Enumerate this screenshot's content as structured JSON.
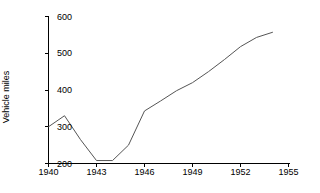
{
  "chart_data": {
    "type": "line",
    "title": "",
    "subtitle": "",
    "xlabel": "",
    "ylabel": "Vehicle miles",
    "xlim": [
      1940,
      1955
    ],
    "ylim": [
      200,
      600
    ],
    "xticks": [
      1940,
      1943,
      1946,
      1949,
      1952,
      1955
    ],
    "xtick_labels": [
      "1940",
      "1943",
      "1946",
      "1949",
      "1952",
      "1955"
    ],
    "yticks": [
      200,
      300,
      400,
      500,
      600
    ],
    "ytick_labels": [
      "200",
      "300",
      "400",
      "500",
      "600"
    ],
    "grid": false,
    "legend": false,
    "legend_position": "none",
    "line_color": "#555555",
    "line_width": 1,
    "axis_color": "#000000",
    "background_color": "#ffffff",
    "x": [
      1940,
      1941,
      1942,
      1943,
      1944,
      1945,
      1946,
      1947,
      1948,
      1949,
      1950,
      1951,
      1952,
      1953,
      1954
    ],
    "values": [
      300,
      330,
      265,
      208,
      208,
      250,
      343,
      370,
      398,
      420,
      450,
      483,
      518,
      543,
      557
    ],
    "series": [
      {
        "name": "Vehicle miles",
        "values": [
          300,
          330,
          265,
          208,
          208,
          250,
          343,
          370,
          398,
          420,
          450,
          483,
          518,
          543,
          557
        ]
      }
    ],
    "annotations": []
  }
}
